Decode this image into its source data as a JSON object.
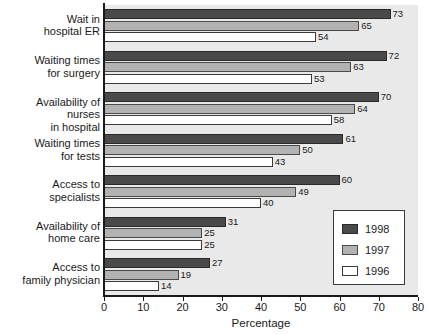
{
  "chart_data": {
    "type": "bar",
    "orientation": "horizontal",
    "title": "",
    "xlabel": "Percentage",
    "ylabel": "",
    "xlim": [
      0,
      80
    ],
    "xticks": [
      0,
      10,
      20,
      30,
      40,
      50,
      60,
      70,
      80
    ],
    "grid": false,
    "legend_position": "bottom-right",
    "categories": [
      "Wait in\nhospital ER",
      "Waiting times\nfor surgery",
      "Availability of nurses\nin hospital",
      "Waiting times\nfor tests",
      "Access to\nspecialists",
      "Availability of\nhome care",
      "Access to\nfamily physician"
    ],
    "series": [
      {
        "name": "1998",
        "color": "#4a4a4a",
        "values": [
          73,
          72,
          70,
          61,
          60,
          31,
          27
        ]
      },
      {
        "name": "1997",
        "color": "#b2b2b2",
        "values": [
          65,
          63,
          64,
          50,
          49,
          25,
          19
        ]
      },
      {
        "name": "1996",
        "color": "#ffffff",
        "values": [
          54,
          53,
          58,
          43,
          40,
          25,
          14
        ]
      }
    ]
  },
  "legend": {
    "entries": [
      {
        "label": "1998",
        "swatch": "dark-gray-swatch"
      },
      {
        "label": "1997",
        "swatch": "medium-gray-swatch"
      },
      {
        "label": "1996",
        "swatch": "white-swatch"
      }
    ]
  },
  "axis": {
    "x_title": "Percentage",
    "x_tick_labels": [
      "0",
      "10",
      "20",
      "30",
      "40",
      "50",
      "60",
      "70",
      "80"
    ]
  },
  "colors": {
    "series_1998": "#4a4a4a",
    "series_1997": "#b2b2b2",
    "series_1996": "#ffffff",
    "plot_background": "#e9e9e9",
    "axis": "#1a1a1a",
    "text": "#1a1a1a"
  }
}
